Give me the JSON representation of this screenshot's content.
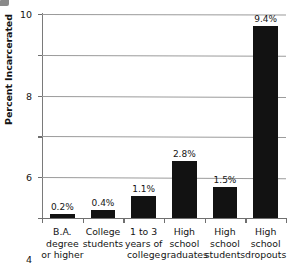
{
  "chart_data": {
    "type": "bar",
    "title": "",
    "xlabel": "",
    "ylabel": "Percent Incarcerated",
    "ylim": [
      0,
      10
    ],
    "yticks": [
      0,
      2,
      4,
      6,
      8,
      10
    ],
    "ytick_labels": [
      "0",
      "2",
      "4",
      "6",
      "8",
      "10"
    ],
    "grid": true,
    "legend": "none",
    "bar_color": "#121212",
    "gridline_color": "#9b9b9b",
    "axis_color": "#6f6f6f",
    "categories": [
      "B.A. degree or higher",
      "College students",
      "1 to 3 years of college",
      "High school graduates",
      "High school students",
      "High school dropouts"
    ],
    "category_lines": [
      [
        "B.A.",
        "degree",
        "or higher"
      ],
      [
        "College",
        "students"
      ],
      [
        "1 to 3",
        "years of",
        "college"
      ],
      [
        "High",
        "school",
        "graduates"
      ],
      [
        "High",
        "school",
        "students"
      ],
      [
        "High",
        "school",
        "dropouts"
      ]
    ],
    "values": [
      0.2,
      0.4,
      1.1,
      2.8,
      1.5,
      9.4
    ],
    "data_labels": [
      "0.2%",
      "0.4%",
      "1.1%",
      "2.8%",
      "1.5%",
      "9.4%"
    ]
  }
}
